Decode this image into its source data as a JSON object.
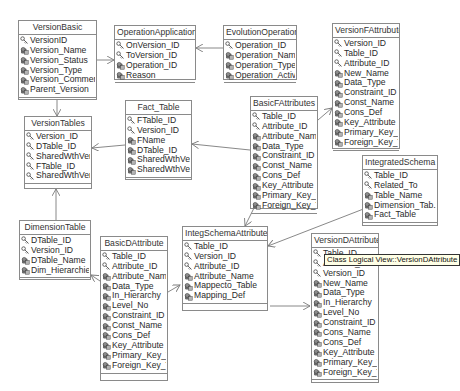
{
  "diagram": {
    "title": "Class Logical View",
    "tooltip": "Class Logical View::VersionDAttribute",
    "classes": {
      "VersionBasic": {
        "name": "VersionBasic",
        "attributes": [
          {
            "name": "VersionID",
            "key": true
          },
          {
            "name": "Version_Name",
            "key": false
          },
          {
            "name": "Version_Status",
            "key": false
          },
          {
            "name": "Version_Type",
            "key": false
          },
          {
            "name": "Version_Comment",
            "key": false
          },
          {
            "name": "Parent_Version",
            "key": false
          }
        ]
      },
      "OperationApplication": {
        "name": "OperationApplication",
        "attributes": [
          {
            "name": "OnVersion_ID",
            "key": true
          },
          {
            "name": "ToVersion_ID",
            "key": true
          },
          {
            "name": "Operation_ID",
            "key": false
          },
          {
            "name": "Reason",
            "key": false
          }
        ]
      },
      "EvolutionOperation": {
        "name": "EvolutionOperation",
        "attributes": [
          {
            "name": "Operation_ID",
            "key": true
          },
          {
            "name": "Operation_Name",
            "key": false
          },
          {
            "name": "Operation_Type",
            "key": false
          },
          {
            "name": "Operation_Activity",
            "key": false
          }
        ]
      },
      "VersionFAttribute": {
        "name": "VersionFAttrubute",
        "attributes": [
          {
            "name": "Version_ID",
            "key": true
          },
          {
            "name": "Table_ID",
            "key": true
          },
          {
            "name": "Attribute_ID",
            "key": true
          },
          {
            "name": "New_Name",
            "key": false
          },
          {
            "name": "Data_Type",
            "key": false
          },
          {
            "name": "Constraint_ID",
            "key": false
          },
          {
            "name": "Const_Name",
            "key": false
          },
          {
            "name": "Cons_Def",
            "key": false
          },
          {
            "name": "Key_Attribute",
            "key": false
          },
          {
            "name": "Primary_Key_To",
            "key": false
          },
          {
            "name": "Foreign_Key_To",
            "key": false
          }
        ]
      },
      "FactTable": {
        "name": "Fact_Table",
        "attributes": [
          {
            "name": "FTable_ID",
            "key": true
          },
          {
            "name": "Version_ID",
            "key": true
          },
          {
            "name": "FName",
            "key": false
          },
          {
            "name": "DTable_ID",
            "key": false
          },
          {
            "name": "SharedWthVer",
            "key": false
          },
          {
            "name": "SharedWthVer1",
            "key": false
          }
        ]
      },
      "BasicFAttributes": {
        "name": "BasicFAttributes",
        "attributes": [
          {
            "name": "Table_ID",
            "key": true
          },
          {
            "name": "Attribute_ID",
            "key": true
          },
          {
            "name": "Attribute_Name",
            "key": false
          },
          {
            "name": "Data_Type",
            "key": false
          },
          {
            "name": "Constraint_ID",
            "key": false
          },
          {
            "name": "Const_Name",
            "key": false
          },
          {
            "name": "Cons_Def",
            "key": false
          },
          {
            "name": "Key_Attribute",
            "key": false
          },
          {
            "name": "Primary_Key_To",
            "key": false
          },
          {
            "name": "Foreign_Key_To",
            "key": false
          }
        ]
      },
      "VersionTables": {
        "name": "VersionTables",
        "attributes": [
          {
            "name": "Version_ID",
            "key": true
          },
          {
            "name": "DTable_ID",
            "key": true
          },
          {
            "name": "SharedWthVer",
            "key": true
          },
          {
            "name": "FTable_ID",
            "key": true
          },
          {
            "name": "SharedWthVer1",
            "key": true
          }
        ]
      },
      "IntegratedSchema": {
        "name": "IntegratedSchema",
        "attributes": [
          {
            "name": "Table_ID",
            "key": true
          },
          {
            "name": "Related_To",
            "key": true
          },
          {
            "name": "Table_Name",
            "key": false
          },
          {
            "name": "Dimension_Tab...",
            "key": false
          },
          {
            "name": "Fact_Table",
            "key": false
          }
        ]
      },
      "DimensionTable": {
        "name": "DimensionTable",
        "attributes": [
          {
            "name": "DTable_ID",
            "key": true
          },
          {
            "name": "Version_ID",
            "key": true
          },
          {
            "name": "DTable_Name",
            "key": false
          },
          {
            "name": "Dim_Hierarchies",
            "key": false
          }
        ]
      },
      "BasicDAttribute": {
        "name": "BasicDAttribute",
        "attributes": [
          {
            "name": "Table_ID",
            "key": true
          },
          {
            "name": "Attribute_ID",
            "key": true
          },
          {
            "name": "Attribute_Name",
            "key": false
          },
          {
            "name": "Data_Type",
            "key": false
          },
          {
            "name": "In_Hierarchy",
            "key": false
          },
          {
            "name": "Level_No",
            "key": false
          },
          {
            "name": "Constraint_ID",
            "key": false
          },
          {
            "name": "Const_Name",
            "key": false
          },
          {
            "name": "Cons_Def",
            "key": false
          },
          {
            "name": "Key_Attribute",
            "key": false
          },
          {
            "name": "Primary_Key_To",
            "key": false
          },
          {
            "name": "Foreign_Key_To",
            "key": false
          }
        ]
      },
      "IntegSchemaAttribute": {
        "name": "IntegSchemaAttribute",
        "attributes": [
          {
            "name": "Table_ID",
            "key": true
          },
          {
            "name": "Version_ID",
            "key": true
          },
          {
            "name": "Attribute_ID",
            "key": true
          },
          {
            "name": "Attribute_Name",
            "key": false
          },
          {
            "name": "Mappecto_Table",
            "key": false
          },
          {
            "name": "Mapping_Def",
            "key": false
          }
        ]
      },
      "VersionDAttribute": {
        "name": "VersionDAttribute",
        "attributes": [
          {
            "name": "Table_ID",
            "key": true
          },
          {
            "name": "Attribute_ID",
            "key": true
          },
          {
            "name": "Version_ID",
            "key": true
          },
          {
            "name": "New_Name",
            "key": false
          },
          {
            "name": "Data_Type",
            "key": false
          },
          {
            "name": "In_Hierarchy",
            "key": false
          },
          {
            "name": "Level_No",
            "key": false
          },
          {
            "name": "Constraint_ID",
            "key": false
          },
          {
            "name": "Cons_Name",
            "key": false
          },
          {
            "name": "Cons_Def",
            "key": false
          },
          {
            "name": "Key_Attribute",
            "key": false
          },
          {
            "name": "Primary_Key_To",
            "key": false
          },
          {
            "name": "Foreign_Key_To",
            "key": false
          }
        ]
      }
    },
    "colors": {
      "border": "#8a8a8a",
      "line": "#7a7a7a",
      "text": "#2a2a2a",
      "tooltip_bg": "#ffffe6"
    }
  }
}
